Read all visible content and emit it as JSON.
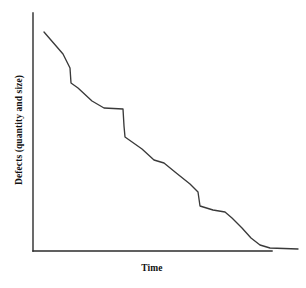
{
  "chart_data": {
    "type": "line",
    "title": "",
    "subtitle": "",
    "xlabel": "Time",
    "ylabel": "Defects (quantity and size)",
    "legend": [],
    "legend_position": "none",
    "grid": false,
    "axis_style": "open-left-bottom",
    "xlim": [
      0,
      100
    ],
    "ylim": [
      0,
      100
    ],
    "x_ticks": [],
    "y_ticks": [],
    "annotations": [],
    "series": [
      {
        "name": "Defects over time",
        "color": "#3a3a3a",
        "x": [
          4.6,
          12.5,
          15.5,
          15.9,
          19.0,
          25.0,
          30.1,
          38.0,
          38.6,
          39.0,
          46.0,
          51.0,
          55.0,
          60.0,
          66.0,
          69.5,
          70.5,
          76.0,
          81.0,
          84.0,
          88.0,
          92.0,
          96.0,
          100.0,
          111.6
        ],
        "y": [
          91.6,
          82.4,
          76.5,
          70.3,
          68.3,
          63.0,
          60.1,
          59.6,
          52.5,
          47.9,
          43.0,
          38.4,
          37.2,
          33.6,
          28.5,
          25.0,
          19.2,
          17.6,
          16.6,
          14.0,
          10.0,
          6.0,
          3.0,
          1.6,
          1.2
        ]
      }
    ],
    "pixel_path": [
      [
        44,
        32
      ],
      [
        63,
        54
      ],
      [
        70,
        68
      ],
      [
        71,
        83
      ],
      [
        78,
        88
      ],
      [
        92,
        101
      ],
      [
        104,
        108
      ],
      [
        123,
        109
      ],
      [
        124,
        126
      ],
      [
        125,
        137
      ],
      [
        142,
        149
      ],
      [
        154,
        160
      ],
      [
        164,
        163
      ],
      [
        175,
        172
      ],
      [
        190,
        184
      ],
      [
        198,
        192
      ],
      [
        200,
        206
      ],
      [
        213,
        210
      ],
      [
        225,
        212
      ],
      [
        232,
        218
      ],
      [
        242,
        228
      ],
      [
        251,
        238
      ],
      [
        260,
        245
      ],
      [
        270,
        248
      ],
      [
        298,
        249
      ]
    ]
  },
  "axes": {
    "x_axis": {
      "x1": 33,
      "y1": 251,
      "x2": 272,
      "y2": 251,
      "color": "#2b2b2b"
    },
    "y_axis": {
      "x1": 33,
      "y1": 13,
      "x2": 33,
      "y2": 251,
      "color": "#2b2b2b"
    }
  },
  "colors": {
    "background": "#ffffff",
    "axis": "#2b2b2b",
    "curve": "#3a3a3a",
    "text": "#111111"
  }
}
